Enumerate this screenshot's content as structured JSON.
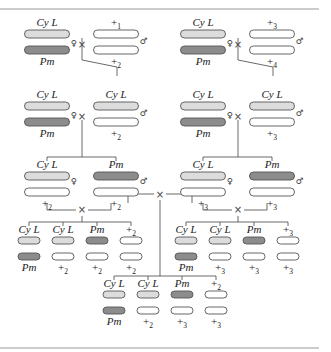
{
  "colors": {
    "cyl": "#dcdcdc",
    "pm": "#8c8c8c",
    "plus": "#ffffff",
    "outline": "#555555"
  },
  "symbols": {
    "female": "♀",
    "male": "♂",
    "cross": "×"
  },
  "crosses": [
    {
      "id": "p-left",
      "female": {
        "top": "Cy L",
        "bottom": "Pm"
      },
      "male": {
        "top": "+",
        "top_sub": "1",
        "bottom": "+",
        "bottom_sub": "2"
      }
    },
    {
      "id": "p-right",
      "female": {
        "top": "Cy L",
        "bottom": "Pm"
      },
      "male": {
        "top": "+",
        "top_sub": "3",
        "bottom": "+",
        "bottom_sub": "4"
      }
    },
    {
      "id": "f1-left",
      "female": {
        "top": "Cy L",
        "bottom": "Pm"
      },
      "male": {
        "top": "Cy L",
        "bottom": "+",
        "bottom_sub": "2"
      }
    },
    {
      "id": "f1-right",
      "female": {
        "top": "Cy L",
        "bottom": "Pm"
      },
      "male": {
        "top": "Cy L",
        "bottom": "+",
        "bottom_sub": "3"
      }
    },
    {
      "id": "f2-left",
      "female": {
        "top": "Cy L",
        "bottom": "+",
        "bottom_sub": "2"
      },
      "male": {
        "top": "Pm",
        "bottom": "+",
        "bottom_sub": "2"
      }
    },
    {
      "id": "f2-right",
      "female": {
        "top": "Cy L",
        "bottom": "+",
        "bottom_sub": "3"
      },
      "male": {
        "top": "Pm",
        "bottom": "+",
        "bottom_sub": "3"
      }
    }
  ],
  "progeny": {
    "left": [
      {
        "top": "Cy L",
        "bottom": "Pm"
      },
      {
        "top": "Cy L",
        "bottom": "+",
        "bottom_sub": "2"
      },
      {
        "top": "Pm",
        "bottom": "+",
        "bottom_sub": "2"
      },
      {
        "top": "+",
        "top_sub": "2",
        "bottom": "+",
        "bottom_sub": "2"
      }
    ],
    "right": [
      {
        "top": "Cy L",
        "bottom": "Pm"
      },
      {
        "top": "Cy L",
        "bottom": "+",
        "bottom_sub": "3"
      },
      {
        "top": "Pm",
        "bottom": "+",
        "bottom_sub": "3"
      },
      {
        "top": "+",
        "top_sub": "3",
        "bottom": "+",
        "bottom_sub": "3"
      }
    ],
    "center": [
      {
        "top": "Cy L",
        "bottom": "Pm"
      },
      {
        "top": "Cy L",
        "bottom": "+",
        "bottom_sub": "2"
      },
      {
        "top": "Pm",
        "bottom": "+",
        "bottom_sub": "3"
      },
      {
        "top": "+",
        "top_sub": "2",
        "bottom": "+",
        "bottom_sub": "3"
      }
    ]
  }
}
